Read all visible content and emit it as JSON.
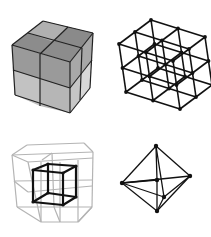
{
  "figure": {
    "width": 211,
    "height": 237,
    "background": "#ffffff",
    "panels": [
      {
        "id": "solid-cube",
        "description": "2x2x2 solid shaded cube",
        "faces": {
          "top": {
            "points": [
              [
                12,
                45
              ],
              [
                43,
                21
              ],
              [
                93,
                33
              ],
              [
                70,
                62
              ]
            ],
            "fill": "#8c8c8c"
          },
          "front": {
            "points": [
              [
                12,
                45
              ],
              [
                70,
                62
              ],
              [
                70,
                113
              ],
              [
                15,
                95
              ]
            ],
            "fill": "#9a9a9a"
          },
          "right": {
            "points": [
              [
                70,
                62
              ],
              [
                93,
                33
              ],
              [
                90,
                88
              ],
              [
                70,
                113
              ]
            ],
            "fill": "#a8a8a8"
          }
        },
        "subcells": [
          {
            "points": [
              [
                13,
                70
              ],
              [
                40,
                79
              ],
              [
                40,
                106
              ],
              [
                15,
                95
              ]
            ],
            "fill": "#c2c2c2"
          },
          {
            "points": [
              [
                40,
                79
              ],
              [
                70,
                88
              ],
              [
                70,
                113
              ],
              [
                40,
                106
              ]
            ],
            "fill": "#b6b6b6"
          },
          {
            "points": [
              [
                70,
                88
              ],
              [
                80,
                74
              ],
              [
                80,
                100
              ],
              [
                70,
                113
              ]
            ],
            "fill": "#c6c6c6"
          },
          {
            "points": [
              [
                80,
                74
              ],
              [
                92,
                60
              ],
              [
                90,
                88
              ],
              [
                80,
                100
              ]
            ],
            "fill": "#d8d8d8"
          },
          {
            "points": [
              [
                43,
                21
              ],
              [
                68,
                27
              ],
              [
                54,
                42
              ],
              [
                28,
                33
              ]
            ],
            "fill": "#b0b0b0"
          },
          {
            "points": [
              [
                68,
                27
              ],
              [
                93,
                33
              ],
              [
                82,
                48
              ],
              [
                54,
                42
              ]
            ],
            "fill": "#8a8a8a"
          }
        ],
        "lines": [
          [
            [
              12,
              45
            ],
            [
              43,
              21
            ]
          ],
          [
            [
              43,
              21
            ],
            [
              93,
              33
            ]
          ],
          [
            [
              93,
              33
            ],
            [
              70,
              62
            ]
          ],
          [
            [
              70,
              62
            ],
            [
              12,
              45
            ]
          ],
          [
            [
              12,
              45
            ],
            [
              15,
              95
            ]
          ],
          [
            [
              15,
              95
            ],
            [
              70,
              113
            ]
          ],
          [
            [
              70,
              113
            ],
            [
              70,
              62
            ]
          ],
          [
            [
              93,
              33
            ],
            [
              90,
              88
            ]
          ],
          [
            [
              90,
              88
            ],
            [
              70,
              113
            ]
          ],
          [
            [
              28,
              33
            ],
            [
              82,
              48
            ]
          ],
          [
            [
              68,
              27
            ],
            [
              40,
              54
            ]
          ],
          [
            [
              40,
              54
            ],
            [
              40,
              106
            ]
          ],
          [
            [
              13,
              70
            ],
            [
              70,
              88
            ]
          ],
          [
            [
              82,
              48
            ],
            [
              80,
              100
            ]
          ],
          [
            [
              70,
              88
            ],
            [
              92,
              60
            ]
          ]
        ],
        "stroke": "#222222"
      },
      {
        "id": "wire-lattice",
        "description": "3x3x3 vertex wireframe lattice",
        "origin": [
          119,
          44
        ],
        "u": [
          27,
          8.5
        ],
        "v": [
          3.5,
          24
        ],
        "w": [
          16,
          -12
        ],
        "n": 3,
        "stroke": "#111111",
        "node_color": "#111111"
      },
      {
        "id": "nested-cube",
        "description": "gray 2x2x2 wire cube with black inner cube",
        "outer": {
          "origin": [
            12,
            155
          ],
          "u": [
            40.5,
            -1.5
          ],
          "v": [
            2.5,
            26
          ],
          "w": [
            0,
            0
          ],
          "stroke": "#b4b4b4",
          "lines": [
            [
              [
                12,
                155
              ],
              [
                93,
                152
              ]
            ],
            [
              [
                12,
                155
              ],
              [
                17,
                207
              ]
            ],
            [
              [
                93,
                152
              ],
              [
                92,
                207
              ]
            ],
            [
              [
                17,
                207
              ],
              [
                41,
                222
              ]
            ],
            [
              [
                41,
                222
              ],
              [
                78,
                222
              ]
            ],
            [
              [
                78,
                222
              ],
              [
                92,
                207
              ]
            ],
            [
              [
                17,
                207
              ],
              [
                92,
                207
              ]
            ],
            [
              [
                52,
                153
              ],
              [
                54,
                207
              ]
            ],
            [
              [
                52,
                153
              ],
              [
                42,
                160
              ]
            ],
            [
              [
                12,
                155
              ],
              [
                28,
                162
              ]
            ],
            [
              [
                28,
                162
              ],
              [
                93,
                158
              ]
            ],
            [
              [
                28,
                162
              ],
              [
                41,
                222
              ]
            ],
            [
              [
                41,
                222
              ],
              [
                41,
                162
              ]
            ],
            [
              [
                14,
                181
              ],
              [
                92,
                180
              ]
            ],
            [
              [
                28,
                192
              ],
              [
                92,
                186
              ]
            ],
            [
              [
                14,
                181
              ],
              [
                28,
                192
              ]
            ],
            [
              [
                60,
                162
              ],
              [
                60,
                222
              ]
            ],
            [
              [
                27,
                145
              ],
              [
                84,
                143
              ]
            ],
            [
              [
                27,
                145
              ],
              [
                12,
                155
              ]
            ],
            [
              [
                84,
                143
              ],
              [
                93,
                152
              ]
            ],
            [
              [
                54,
                207
              ],
              [
                60,
                222
              ]
            ],
            [
              [
                92,
                207
              ],
              [
                78,
                222
              ]
            ],
            [
              [
                78,
                160
              ],
              [
                78,
                222
              ]
            ]
          ]
        },
        "inner": {
          "stroke": "#111111",
          "nodes": [
            [
              33,
              170
            ],
            [
              48,
              164
            ],
            [
              76,
              166
            ],
            [
              63,
              173
            ],
            [
              33,
              202
            ],
            [
              48,
              193
            ],
            [
              76,
              197
            ],
            [
              63,
              205
            ]
          ],
          "edges": [
            [
              0,
              1
            ],
            [
              1,
              2
            ],
            [
              2,
              3
            ],
            [
              3,
              0
            ],
            [
              4,
              5
            ],
            [
              5,
              6
            ],
            [
              6,
              7
            ],
            [
              7,
              4
            ],
            [
              0,
              4
            ],
            [
              1,
              5
            ],
            [
              2,
              6
            ],
            [
              3,
              7
            ]
          ]
        }
      },
      {
        "id": "octahedron",
        "description": "wireframe octahedron with center node",
        "stroke": "#111111",
        "nodes": {
          "top": [
            156,
            146
          ],
          "left": [
            122,
            183
          ],
          "right": [
            190,
            176
          ],
          "center": [
            157,
            180
          ],
          "front": [
            164,
            197
          ],
          "bottom": [
            157,
            211
          ]
        },
        "edges": [
          [
            "top",
            "left"
          ],
          [
            "top",
            "right"
          ],
          [
            "top",
            "front"
          ],
          [
            "top",
            "center"
          ],
          [
            "bottom",
            "left"
          ],
          [
            "bottom",
            "right"
          ],
          [
            "bottom",
            "front"
          ],
          [
            "center",
            "bottom"
          ],
          [
            "left",
            "right"
          ],
          [
            "left",
            "front"
          ],
          [
            "front",
            "right"
          ],
          [
            "left",
            "center"
          ]
        ]
      }
    ]
  }
}
